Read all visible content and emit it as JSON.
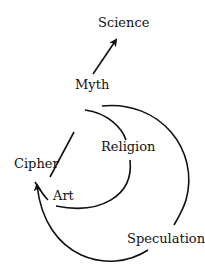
{
  "diagram": {
    "type": "concept-flow",
    "nodes": {
      "science": "Science",
      "myth": "Myth",
      "religion": "Religion",
      "cipher": "Cipher",
      "art": "Art",
      "speculation": "Speculation"
    },
    "edges": [
      {
        "from": "Cipher",
        "to": "Science",
        "via": "Myth",
        "shape": "straight-arrow"
      },
      {
        "from": "Myth",
        "to": "Art",
        "via": "Religion",
        "shape": "inner-arc"
      },
      {
        "from": "Myth",
        "to": "Cipher",
        "via": "Speculation",
        "shape": "outer-arc-arrow"
      }
    ],
    "stroke_color": "#111111",
    "background": "#ffffff"
  }
}
